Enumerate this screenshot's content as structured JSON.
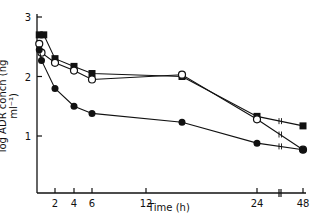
{
  "chart_data": {
    "type": "line",
    "title": "",
    "xlabel": "Time (h)",
    "ylabel": "log ADR concn (ng ml⁻¹)",
    "x_ticks": [
      2,
      4,
      6,
      12,
      24,
      48
    ],
    "y_ticks": [
      1,
      2,
      3
    ],
    "ylim": [
      0,
      3
    ],
    "xlim": [
      0,
      48
    ],
    "grid": false,
    "legend": null,
    "annotations": [
      "axis break between 24 and 48 h"
    ],
    "series": [
      {
        "name": "filled squares",
        "marker": "square-filled",
        "x": [
          0.25,
          0.75,
          2,
          4,
          6,
          16,
          24,
          48
        ],
        "y": [
          2.7,
          2.7,
          2.3,
          2.17,
          2.05,
          2.0,
          1.33,
          1.17
        ]
      },
      {
        "name": "open circles",
        "marker": "circle-open",
        "x": [
          0.25,
          0.5,
          2,
          4,
          6,
          16,
          24,
          48
        ],
        "y": [
          2.55,
          2.4,
          2.23,
          2.1,
          1.95,
          2.03,
          1.28,
          0.77
        ]
      },
      {
        "name": "filled circles",
        "marker": "circle-filled",
        "x": [
          0.25,
          0.5,
          2,
          4,
          6,
          16,
          24,
          48
        ],
        "y": [
          2.45,
          2.27,
          1.8,
          1.5,
          1.38,
          1.23,
          0.88,
          0.77
        ]
      }
    ]
  }
}
